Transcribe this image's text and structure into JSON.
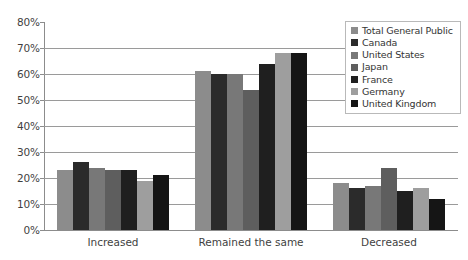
{
  "chart_data": {
    "type": "bar",
    "title": "",
    "subtitle": "",
    "xlabel": "",
    "ylabel": "",
    "ylim": [
      0,
      80
    ],
    "ytick_labels": [
      "80%",
      "70%",
      "60%",
      "50%",
      "40%",
      "30%",
      "20%",
      "10%",
      "0%"
    ],
    "ytick_values": [
      80,
      70,
      60,
      50,
      40,
      30,
      20,
      10,
      0
    ],
    "grid": true,
    "grid_axis": "y",
    "legend_position": "top-right",
    "categories": [
      "Increased",
      "Remained the same",
      "Decreased"
    ],
    "series": [
      {
        "name": "Total General Public",
        "color": "#8c8c8c",
        "values": [
          23,
          61,
          18
        ]
      },
      {
        "name": "Canada",
        "color": "#2b2b2b",
        "values": [
          26,
          60,
          16
        ]
      },
      {
        "name": "United States",
        "color": "#787878",
        "values": [
          24,
          60,
          17
        ]
      },
      {
        "name": "Japan",
        "color": "#5e5e5e",
        "values": [
          23,
          54,
          24
        ]
      },
      {
        "name": "France",
        "color": "#1f1f1f",
        "values": [
          23,
          64,
          15
        ]
      },
      {
        "name": "Germany",
        "color": "#9e9e9e",
        "values": [
          19,
          68,
          16
        ]
      },
      {
        "name": "United Kingdom",
        "color": "#151515",
        "values": [
          21,
          68,
          12
        ]
      }
    ]
  },
  "legend": {
    "items": [
      {
        "label": "Total General Public"
      },
      {
        "label": "Canada"
      },
      {
        "label": "United States"
      },
      {
        "label": "Japan"
      },
      {
        "label": "France"
      },
      {
        "label": "Germany"
      },
      {
        "label": "United Kingdom"
      }
    ]
  },
  "axis": {
    "y_labels": [
      "80%",
      "70%",
      "60%",
      "50%",
      "40%",
      "30%",
      "20%",
      "10%",
      "0%"
    ],
    "x_labels": [
      "Increased",
      "Remained the same",
      "Decreased"
    ]
  },
  "colors": {
    "gridline": "#9a9a9a",
    "axis": "#8c8c8c",
    "text": "#3f3f3f",
    "legend_border": "#b9b9b9",
    "background": "#ffffff"
  }
}
